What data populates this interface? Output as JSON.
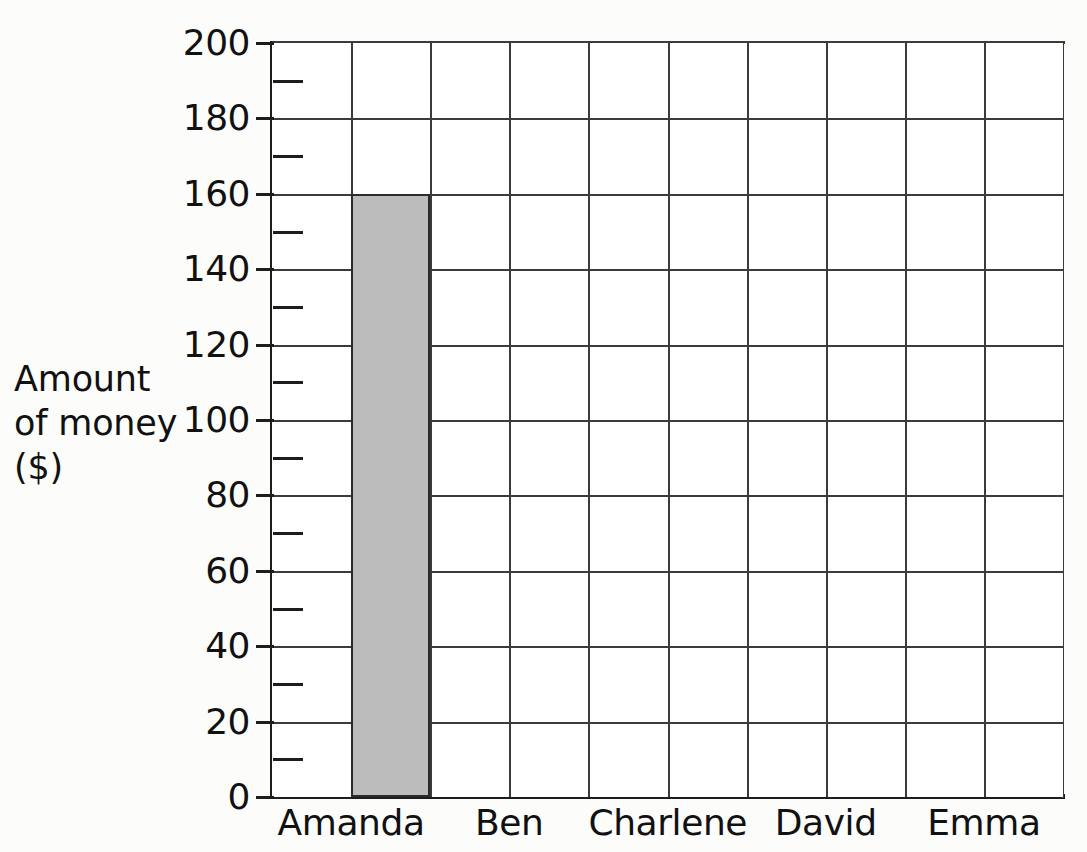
{
  "chart_data": {
    "type": "bar",
    "title": "",
    "xlabel": "",
    "ylabel": "Amount\nof money\n($)",
    "ylabel_lines": [
      "Amount",
      "of money",
      "($)"
    ],
    "categories": [
      "Amanda",
      "Ben",
      "Charlene",
      "David",
      "Emma"
    ],
    "values": [
      160,
      null,
      null,
      null,
      null
    ],
    "values_display": [
      "160",
      "",
      "",
      "",
      ""
    ],
    "ylim": [
      0,
      200
    ],
    "ytick_major": [
      0,
      20,
      40,
      60,
      80,
      100,
      120,
      140,
      160,
      180,
      200
    ],
    "ytick_major_labels": [
      "0",
      "20",
      "40",
      "60",
      "80",
      "100",
      "120",
      "140",
      "160",
      "180",
      "200"
    ],
    "ytick_minor": [
      10,
      30,
      50,
      70,
      90,
      110,
      130,
      150,
      170,
      190
    ],
    "grid": "both",
    "grid_columns": 10,
    "legend": "none",
    "bar_fill_color": "#bcbcbc",
    "bar_edge_color": "#2b2b2b",
    "grid_color": "#3b3b3b",
    "axis_color": "#1d1d1d",
    "background_color": "#fcfcfb"
  }
}
